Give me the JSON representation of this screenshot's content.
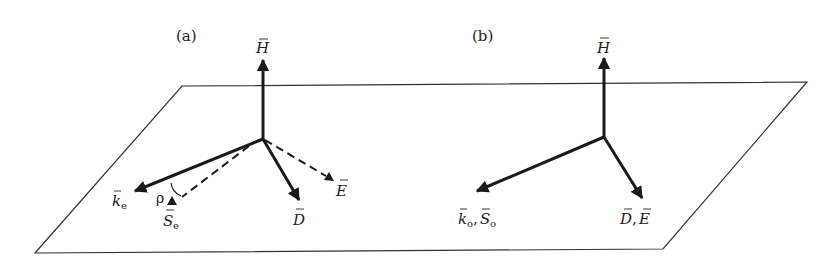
{
  "figure": {
    "panels": [
      {
        "id": "a",
        "label": "(a)",
        "vectors": {
          "H": {
            "symbol": "H",
            "style": "solid"
          },
          "k": {
            "symbol": "k",
            "sub": "e",
            "style": "solid"
          },
          "S": {
            "symbol": "S",
            "sub": "e",
            "style": "dashed"
          },
          "D": {
            "symbol": "D",
            "style": "solid"
          },
          "E": {
            "symbol": "E",
            "style": "dashed"
          }
        },
        "angle_label": "ρ"
      },
      {
        "id": "b",
        "label": "(b)",
        "vectors": {
          "H": {
            "symbol": "H",
            "style": "solid"
          },
          "kS": {
            "symbol1": "k",
            "sub1": "o",
            "sep": ", ",
            "symbol2": "S",
            "sub2": "o",
            "style": "solid"
          },
          "DE": {
            "symbol1": "D",
            "sep": ", ",
            "symbol2": "E",
            "style": "solid"
          }
        }
      }
    ],
    "colors": {
      "line": "#1a1a1a",
      "plane": "#333333",
      "background": "#ffffff"
    }
  }
}
